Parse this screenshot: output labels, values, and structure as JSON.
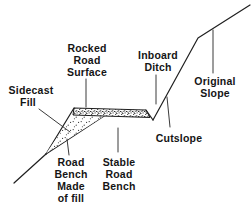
{
  "diagram": {
    "title_hint": "Road cross-section on a hillslope",
    "labels": {
      "rocked_road_surface": {
        "lines": [
          "Rocked",
          "Road",
          "Surface"
        ]
      },
      "sidecast_fill": {
        "lines": [
          "Sidecast",
          "Fill"
        ]
      },
      "inboard_ditch": {
        "lines": [
          "Inboard",
          "Ditch"
        ]
      },
      "original_slope": {
        "lines": [
          "Original",
          "Slope"
        ]
      },
      "cutslope": {
        "lines": [
          "Cutslope"
        ]
      },
      "stable_road_bench": {
        "lines": [
          "Stable",
          "Road",
          "Bench"
        ]
      },
      "road_bench_made_of_fill": {
        "lines": [
          "Road",
          "Bench",
          "Made",
          "of fill"
        ]
      }
    },
    "colors": {
      "background": "#ffffff",
      "line": "#1f1f1f",
      "text": "#151515",
      "stipple": "#2a2a2a"
    }
  }
}
